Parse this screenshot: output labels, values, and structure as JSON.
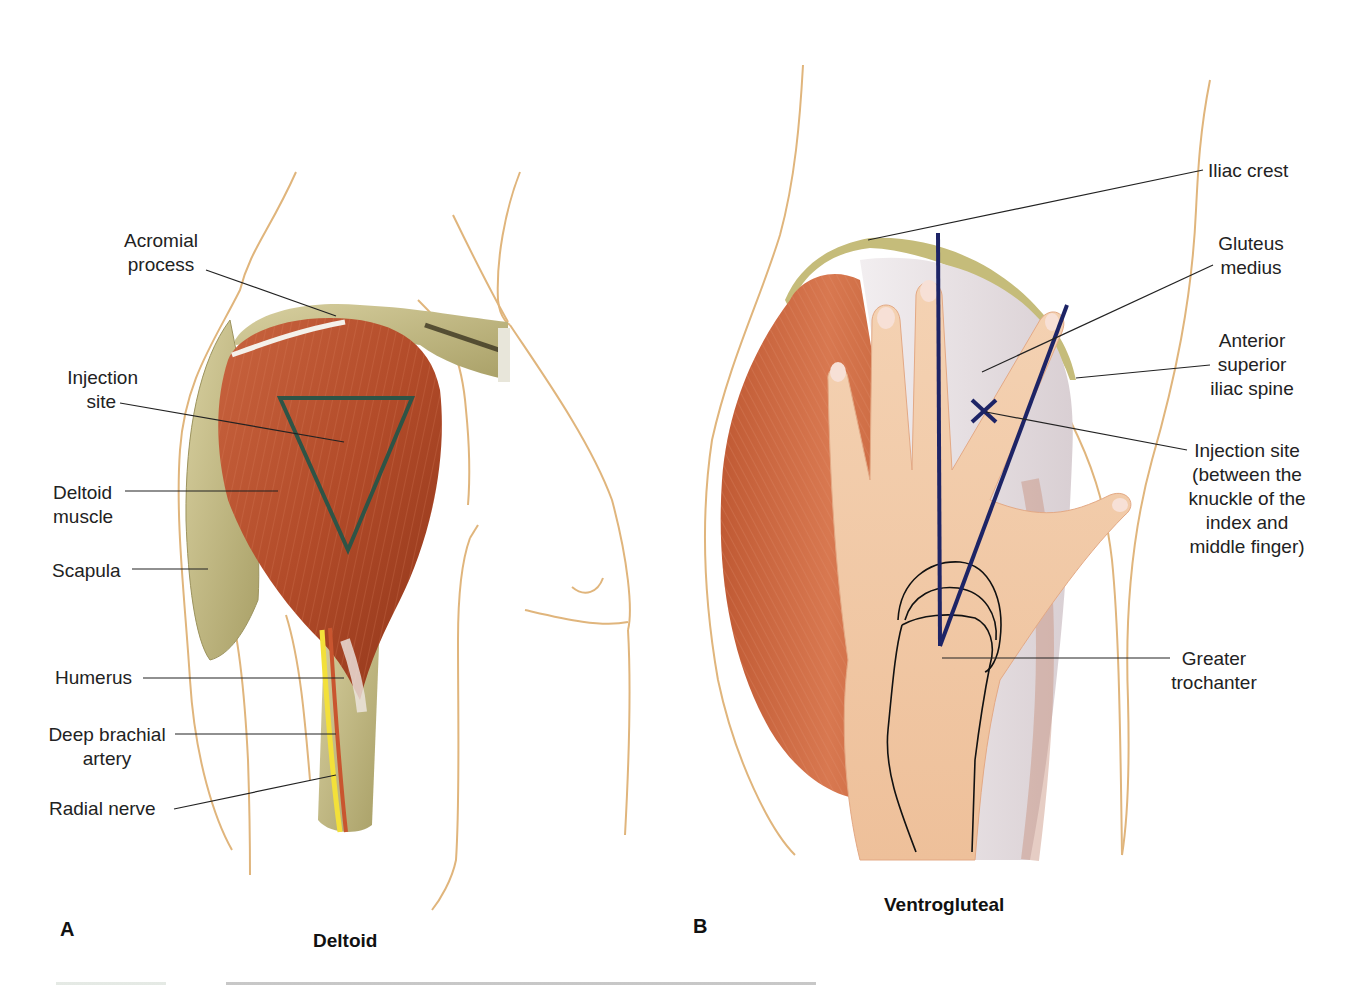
{
  "figure": {
    "panels": [
      {
        "letter": "A",
        "title": "Deltoid",
        "labels": {
          "acromial": [
            "Acromial",
            "process"
          ],
          "injection_site": [
            "Injection",
            "site"
          ],
          "deltoid_muscle": [
            "Deltoid",
            "muscle"
          ],
          "scapula": "Scapula",
          "humerus": "Humerus",
          "deep_brachial": [
            "Deep brachial",
            "artery"
          ],
          "radial_nerve": "Radial nerve"
        },
        "marker": {
          "shape": "triangle",
          "color": "#2e5446"
        }
      },
      {
        "letter": "B",
        "title": "Ventrogluteal",
        "labels": {
          "iliac_crest": "Iliac crest",
          "gluteus_medius": [
            "Gluteus",
            "medius"
          ],
          "asis": [
            "Anterior",
            "superior",
            "iliac spine"
          ],
          "injection_site": [
            "Injection site",
            "(between the",
            "knuckle of the",
            "index and",
            "middle finger)"
          ],
          "greater_trochanter": [
            "Greater",
            "trochanter"
          ]
        },
        "marker": {
          "shape": "V-lines-with-x",
          "color": "#1d2466"
        }
      }
    ],
    "colors": {
      "muscle": "#b8502e",
      "bone": "#c9c08a",
      "skin_outline": "#e0b57c",
      "hand": "#f2c9a4",
      "tendon": "#e8e4e6"
    }
  }
}
